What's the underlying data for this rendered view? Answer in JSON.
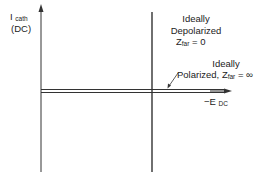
{
  "diagram": {
    "y_axis": {
      "label_main": "I",
      "label_sub": "cath",
      "label_line2": "(DC)"
    },
    "x_axis": {
      "label_prefix": "−E",
      "label_sub": "DC"
    },
    "depolarized": {
      "line1": "Ideally",
      "line2": "Depolarized",
      "z_main": "Z",
      "z_sub": "far",
      "z_value": "= 0"
    },
    "polarized": {
      "line1": "Ideally",
      "line2_prefix": "Polarized, Z",
      "z_sub": "far",
      "z_value": "= ∞"
    },
    "colors": {
      "ink": "#222222",
      "background": "#ffffff"
    }
  }
}
